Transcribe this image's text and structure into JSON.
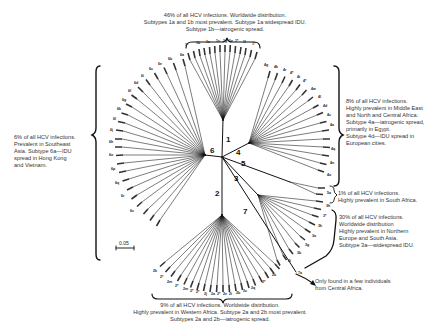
{
  "figure": {
    "scale_bar": "0.05",
    "genotypes": [
      {
        "id": "1",
        "label": "1"
      },
      {
        "id": "2",
        "label": "2"
      },
      {
        "id": "3",
        "label": "3"
      },
      {
        "id": "4",
        "label": "4"
      },
      {
        "id": "5",
        "label": "5"
      },
      {
        "id": "6",
        "label": "6"
      },
      {
        "id": "7",
        "label": "7"
      }
    ],
    "subtype_labels": {
      "g1": [
        "1*",
        "1b",
        "1a",
        "1c",
        "1g",
        "1e",
        "1*",
        "1l",
        "1*"
      ],
      "g4": [
        "4g",
        "4k",
        "4r",
        "4*",
        "4t",
        "4*",
        "4w",
        "4l",
        "4d",
        "4c",
        "4a",
        "4q",
        "4n",
        "4o"
      ],
      "g6": [
        "6a",
        "6b",
        "6e",
        "6c",
        "6i",
        "6d",
        "6f",
        "6g",
        "6k",
        "6l",
        "6j",
        "6h",
        "6o",
        "6p",
        "6q",
        "6r",
        "6v"
      ],
      "g5": [
        "5a"
      ],
      "g3": [
        "3h",
        "3*",
        "3k",
        "3a",
        "3g",
        "3b",
        "3i"
      ],
      "g2": [
        "2k",
        "2*",
        "2m",
        "2*",
        "2m",
        "2*",
        "2*",
        "2j",
        "2a",
        "2*",
        "2e",
        "2i",
        "2b",
        "2c",
        "2q",
        "2*",
        "2b"
      ],
      "g7": [
        "7a"
      ]
    }
  },
  "annotations": {
    "genotype1": {
      "lines": [
        "46% of all HCV infections. Worldwide distribution.",
        "Subtypes 1a and 1b most prevalent. Subtype 1a widespread IDU.",
        "Subtype 1b—iatrogenic spread."
      ]
    },
    "genotype4": {
      "lines": [
        "8% of all HCV infections.",
        "Highly prevalent in Middle East",
        "and North and Central Africa.",
        "Subtype 4a—iatrogenic spread,",
        "primarily in Egypt.",
        "Subtype 4d—IDU spread in",
        "European cities."
      ]
    },
    "genotype6": {
      "lines": [
        "6% of all HCV infections.",
        "Prevalent in Southeast",
        "Asia. Subtype 6a—IDU",
        "spread in Hong Kong",
        "and Vietnam."
      ]
    },
    "genotype5": {
      "lines": [
        "1% of all HCV infections.",
        "Highly prevalent in South Africa."
      ]
    },
    "genotype3": {
      "lines": [
        "30% of all HCV infections.",
        "Worldwide distribution",
        "Highly prevalent in Northern",
        "Europe and South Asia.",
        "Subtype 3a—widespread IDU."
      ]
    },
    "genotype7": {
      "lines": [
        "Only found in a few individuals",
        "from Central Africa."
      ]
    },
    "genotype2": {
      "lines": [
        "9% of all HCV infections. Worldwide distribution.",
        "Highly prevalent in Western Africa. Subtype 2a and 2b most prevalent.",
        "Subtypes 2a and 2b—iatrogenic spread."
      ]
    }
  },
  "colors": {
    "line": "#111111",
    "text": "#333333",
    "background": "#ffffff"
  }
}
